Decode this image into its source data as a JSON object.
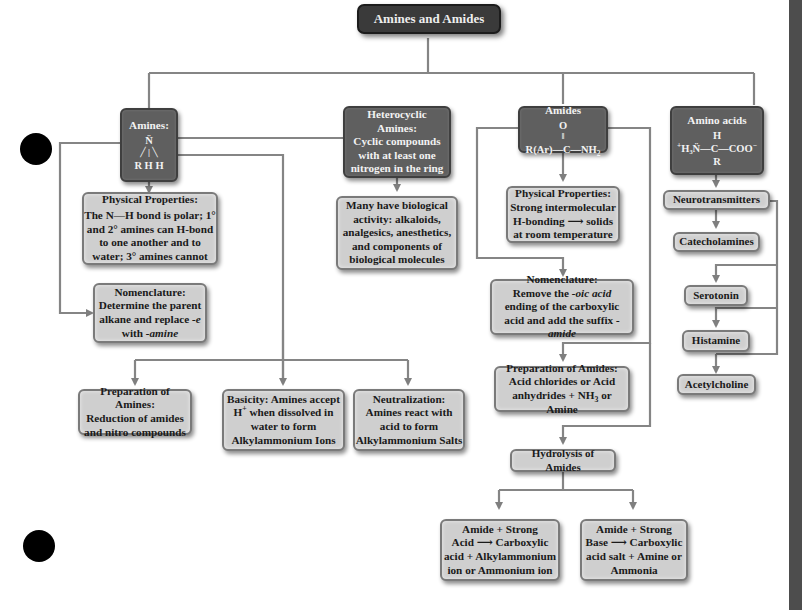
{
  "title": "Amines and Amides",
  "colors": {
    "dark_box": "#5f5f5f",
    "light_box": "#cfcfcf",
    "title_box": "#3a3a3a",
    "connector": "#7a7a7a",
    "sidebar": "#4d4d4d"
  },
  "amines": {
    "label": "Amines:",
    "formula": {
      "top": "N̈",
      "bottom": "R H H"
    },
    "physical": {
      "heading": "Physical Properties:",
      "body": "The N—H bond is polar; 1° and 2° amines can H-bond to one another and to water; 3° amines cannot"
    },
    "nomenclature": {
      "heading": "Nomenclature:",
      "body_1": "Determine the parent alkane and replace ",
      "body_em1": "-e",
      "body_2": " with ",
      "body_em2": "-amine"
    },
    "preparation": {
      "heading": "Preparation of Amines:",
      "body": "Reduction of amides and nitro compounds"
    },
    "basicity": {
      "line1": "Basicity: Amines accept",
      "line2a": "H",
      "line2sup": "+",
      "line2b": " when dissolved in",
      "line3": "water to form",
      "line4": "Alkylammonium Ions"
    },
    "neutralization": {
      "heading": "Neutralization:",
      "body": "Amines react with acid to form Alkylammonium Salts"
    }
  },
  "heterocyclic": {
    "heading": "Heterocyclic Amines:",
    "body": "Cyclic compounds with at least one nitrogen in the ring",
    "activity": "Many have biological activity: alkaloids, analgesics, anesthetics, and components of biological molecules"
  },
  "amides": {
    "label": "Amides",
    "formula": {
      "top": "O",
      "bond": "‖",
      "main": "R(Ar)—C—NH",
      "sub": "2"
    },
    "physical": {
      "heading": "Physical Properties:",
      "line1": "Strong intermolecular",
      "line2": "H-bonding ⟶ solids",
      "line3": "at room temperature"
    },
    "nomenclature": {
      "heading": "Nomenclature:",
      "line1a": "Remove the ",
      "line1em": "-oic acid",
      "line2": "ending of the carboxylic",
      "line3a": "acid and add the suffix ",
      "line3em": "-amide"
    },
    "preparation": {
      "heading": "Preparation of Amides:",
      "line1": "Acid chlorides or Acid",
      "line2a": "anhydrides + NH",
      "line2sub": "3",
      "line2b": " or Amine"
    },
    "hydrolysis": "Hydrolysis of Amides",
    "acid_hydrolysis": {
      "line1": "Amide + Strong",
      "line2": "Acid ⟶ Carboxylic",
      "line3": "acid + Alkylammonium",
      "line4": "ion or Ammonium ion"
    },
    "base_hydrolysis": {
      "line1": "Amide + Strong",
      "line2": "Base ⟶ Carboxylic",
      "line3": "acid salt + Amine or",
      "line4": "Ammonia"
    }
  },
  "amino_acids": {
    "label": "Amino acids",
    "formula": {
      "top": "H",
      "left": "H₃N̈",
      "plus": "+",
      "mid": "—C—COO",
      "minus": "−",
      "bottom": "R"
    },
    "neurotransmitters": "Neurotransmitters",
    "items": [
      "Catecholamines",
      "Serotonin",
      "Histamine",
      "Acetylcholine"
    ]
  }
}
